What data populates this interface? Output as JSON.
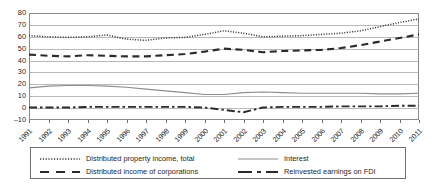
{
  "chart_data": {
    "type": "line",
    "title": "",
    "xlabel": "",
    "ylabel": "",
    "ylim": [
      -10,
      80
    ],
    "ytick_step": 10,
    "grid": true,
    "legend_position": "bottom",
    "yticks": [
      "80",
      "70",
      "60",
      "50",
      "40",
      "30",
      "20",
      "10",
      "0",
      "-10"
    ],
    "categories": [
      "1991",
      "1992",
      "1993",
      "1994",
      "1995",
      "1996",
      "1997",
      "1998",
      "1999",
      "2000",
      "2001",
      "2002",
      "2003",
      "2004",
      "2005",
      "2006",
      "2007",
      "2008",
      "2009",
      "2010",
      "2011"
    ],
    "series": [
      {
        "name": "Distributed property income, total",
        "style": "dotted",
        "color": "#3a3a3a",
        "values": [
          61,
          60,
          59.5,
          60,
          61.5,
          58,
          57,
          59,
          59.5,
          62,
          65,
          63,
          60,
          60.5,
          61,
          62,
          63,
          65,
          68.5,
          72,
          75
        ]
      },
      {
        "name": "Distributed income of corporations",
        "style": "dashed",
        "color": "#2b2b2b",
        "values": [
          45,
          44,
          43.5,
          44.5,
          44,
          43.5,
          43.5,
          44.5,
          45.5,
          47.5,
          50,
          49,
          47,
          48,
          48.5,
          49,
          50.5,
          53,
          56,
          59,
          62
        ]
      },
      {
        "name": "Interest",
        "style": "solid",
        "color": "#8d8d8d",
        "values": [
          17,
          18.5,
          19,
          19,
          18.5,
          17.5,
          16,
          14.5,
          13,
          11.5,
          11.5,
          13,
          13.5,
          13,
          12.5,
          12.5,
          12.5,
          12.5,
          12,
          12,
          12.5
        ]
      },
      {
        "name": "Reinvested earnings on FDI",
        "style": "dash-dot",
        "color": "#2b2b2b",
        "values": [
          0.5,
          0.5,
          0.5,
          1,
          1,
          1,
          1,
          1,
          1,
          0.5,
          -1.5,
          -3.5,
          0.5,
          1,
          1,
          1,
          1.5,
          1.5,
          1.5,
          2,
          2
        ]
      }
    ]
  },
  "legend": {
    "entries": [
      {
        "label": "Distributed property income, total"
      },
      {
        "label": "Distributed income of corporations"
      },
      {
        "label": "Interest"
      },
      {
        "label": "Reinvested earnings on FDI"
      }
    ]
  }
}
